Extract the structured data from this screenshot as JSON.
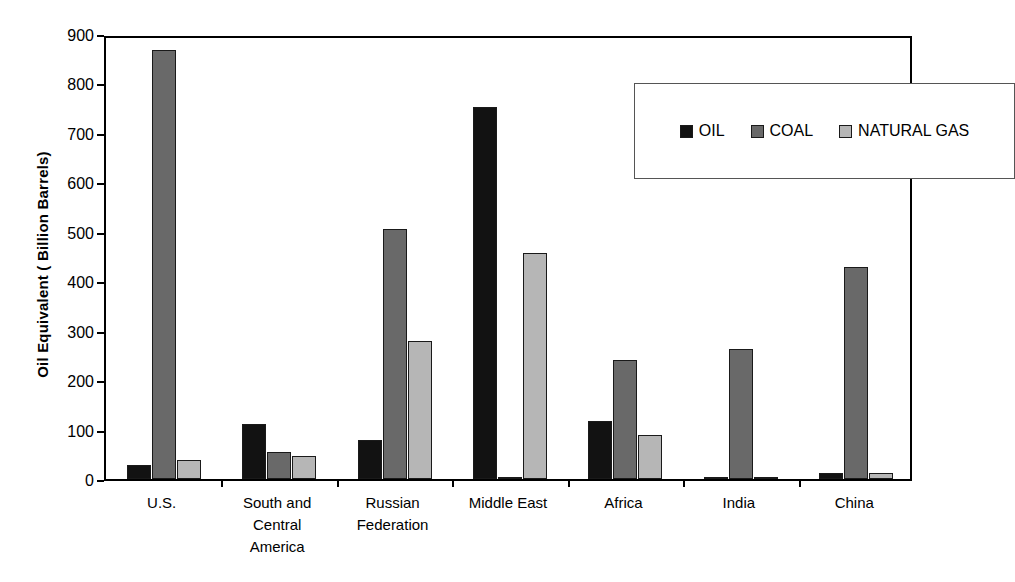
{
  "chart_data": {
    "type": "bar",
    "title": "",
    "xlabel": "",
    "ylabel": "Oil Equivalent ( Billion Barrels)",
    "ylim": [
      0,
      900
    ],
    "ytick_labels": [
      "900",
      "800",
      "700",
      "600",
      "500",
      "400",
      "300",
      "200",
      "100",
      "0"
    ],
    "ytick_values": [
      900,
      800,
      700,
      600,
      500,
      400,
      300,
      200,
      100,
      0
    ],
    "grid": false,
    "legend_position": "top-right",
    "categories": [
      "U.S.",
      "South and\nCentral\nAmerica",
      "Russian\nFederation",
      "Middle East",
      "Africa",
      "India",
      "China"
    ],
    "series": [
      {
        "name": "OIL",
        "color": "#121212",
        "values": [
          29,
          112,
          79,
          753,
          117,
          5,
          13
        ]
      },
      {
        "name": "COAL",
        "color": "#696969",
        "values": [
          867,
          55,
          505,
          5,
          240,
          263,
          428
        ]
      },
      {
        "name": "NATURAL GAS",
        "color": "#b6b6b6",
        "values": [
          39,
          47,
          279,
          458,
          90,
          5,
          12
        ]
      }
    ]
  },
  "legend": {
    "items": [
      {
        "label": "OIL",
        "swatch": "oil-swatch"
      },
      {
        "label": "COAL",
        "swatch": "coal-swatch"
      },
      {
        "label": "NATURAL GAS",
        "swatch": "natural-gas-swatch"
      }
    ]
  },
  "colors": {
    "oil": "#121212",
    "coal": "#696969",
    "natural_gas": "#b6b6b6",
    "axis": "#000000",
    "background": "#ffffff"
  }
}
